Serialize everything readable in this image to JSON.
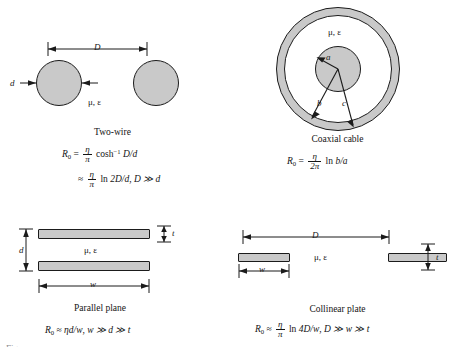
{
  "figure": {
    "medium_label": "μ, ε",
    "panels": [
      {
        "id": "two-wire",
        "caption": "Two-wire",
        "dimensions": {
          "separation": "D",
          "diameter": "d"
        },
        "formula_main": {
          "lhs": "R",
          "lhs_sub": "0",
          "rel": "=",
          "num": "η",
          "den": "π",
          "fn": "cosh",
          "fn_sup": "−1",
          "arg": "D/d"
        },
        "formula_approx": {
          "rel": "≈",
          "num": "η",
          "den": "π",
          "fn": "ln",
          "arg": "2D/d",
          "condition": "D ≫ d"
        }
      },
      {
        "id": "coaxial-cable",
        "caption": "Coaxial cable",
        "dimensions": {
          "inner_radius": "a",
          "shield_inner_radius": "b",
          "shield_outer_radius": "c"
        },
        "formula_main": {
          "lhs": "R",
          "lhs_sub": "0",
          "rel": "=",
          "num": "η",
          "den": "2π",
          "fn": "ln",
          "arg": "b/a"
        }
      },
      {
        "id": "parallel-plane",
        "caption": "Parallel plane",
        "dimensions": {
          "gap": "d",
          "thickness": "t",
          "width": "w"
        },
        "formula_main": {
          "lhs": "R",
          "lhs_sub": "0",
          "rel": "≈",
          "expr": "ηd/w",
          "condition": "w ≫ d ≫ t"
        }
      },
      {
        "id": "collinear-plate",
        "caption": "Collinear plate",
        "dimensions": {
          "separation": "D",
          "width": "w",
          "thickness": "t"
        },
        "formula_main": {
          "lhs": "R",
          "lhs_sub": "0",
          "rel": "≈",
          "num": "η",
          "den": "π",
          "fn": "ln",
          "arg": "4D/w",
          "condition": "D ≫ w ≫ t"
        }
      }
    ],
    "cropped_caption": "Figure",
    "colors": {
      "shape_fill": "#c9c9c9",
      "outline": "#1b1b1b",
      "background": "#ffffff",
      "text": "#141414"
    }
  }
}
